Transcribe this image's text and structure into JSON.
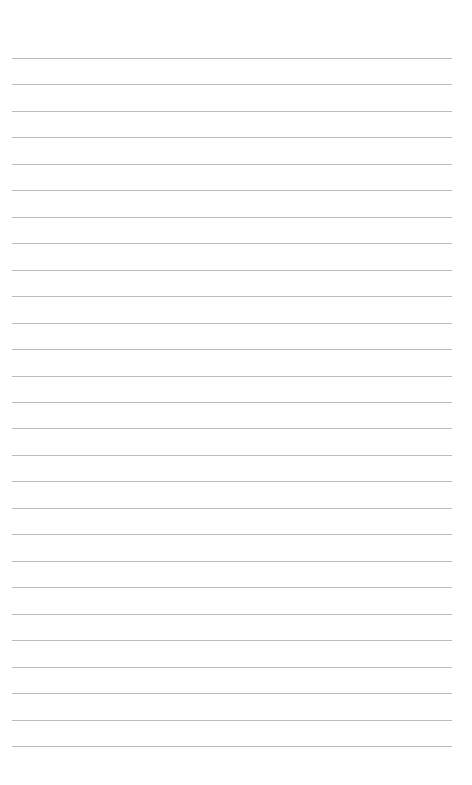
{
  "page": {
    "type": "lined-paper",
    "background": "#fefefe",
    "line_color": "#bcbcbc",
    "line_count": 27,
    "first_line_y": 58,
    "line_spacing": 26.46,
    "line_left": 12,
    "line_width": 440
  }
}
